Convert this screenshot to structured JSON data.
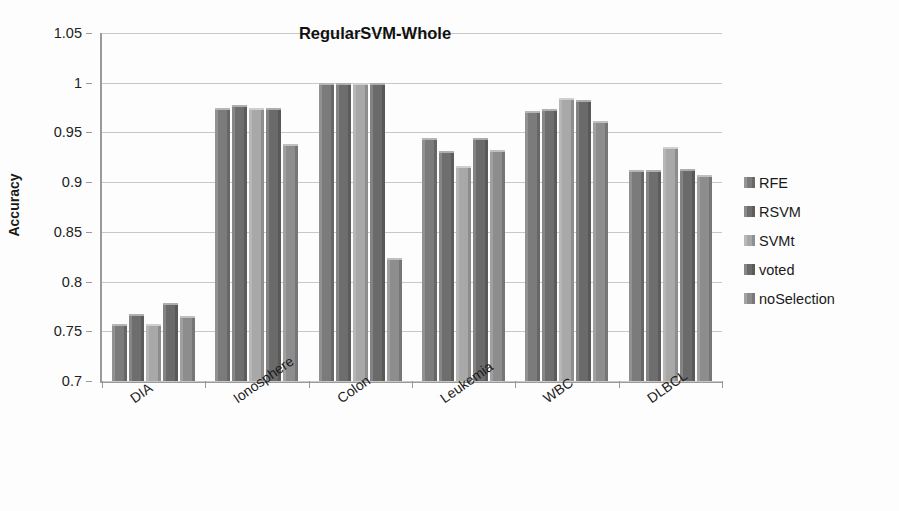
{
  "chart_data": {
    "type": "bar",
    "title": "RegularSVM-Whole",
    "xlabel": "",
    "ylabel": "Accuracy",
    "ylim": [
      0.7,
      1.05
    ],
    "ytick_step": 0.05,
    "ytick_labels": [
      "1.05",
      "1",
      "0.95",
      "0.9",
      "0.85",
      "0.8",
      "0.75",
      "0.7"
    ],
    "ytick_values": [
      1.05,
      1.0,
      0.95,
      0.9,
      0.85,
      0.8,
      0.75,
      0.7
    ],
    "grid": true,
    "legend_position": "right",
    "categories": [
      "DIA",
      "Ionosphere",
      "Colon",
      "Leukemia",
      "WBC",
      "DLBCL"
    ],
    "series": [
      {
        "name": "RFE",
        "color": "#7b7b7b",
        "values": [
          0.757,
          0.975,
          1.0,
          0.944,
          0.972,
          0.912
        ]
      },
      {
        "name": "RSVM",
        "color": "#6e6e6e",
        "values": [
          0.767,
          0.978,
          1.0,
          0.931,
          0.974,
          0.912
        ]
      },
      {
        "name": "SVMt",
        "color": "#a8a8a8",
        "values": [
          0.757,
          0.975,
          1.0,
          0.916,
          0.985,
          0.935
        ]
      },
      {
        "name": "voted",
        "color": "#6a6a6a",
        "values": [
          0.778,
          0.975,
          1.0,
          0.944,
          0.983,
          0.913
        ]
      },
      {
        "name": "noSelection",
        "color": "#8d8d8d",
        "values": [
          0.765,
          0.938,
          0.824,
          0.932,
          0.962,
          0.907
        ]
      }
    ]
  },
  "legend": {
    "items": [
      {
        "label": "RFE"
      },
      {
        "label": "RSVM"
      },
      {
        "label": "SVMt"
      },
      {
        "label": "voted"
      },
      {
        "label": "noSelection"
      }
    ]
  }
}
